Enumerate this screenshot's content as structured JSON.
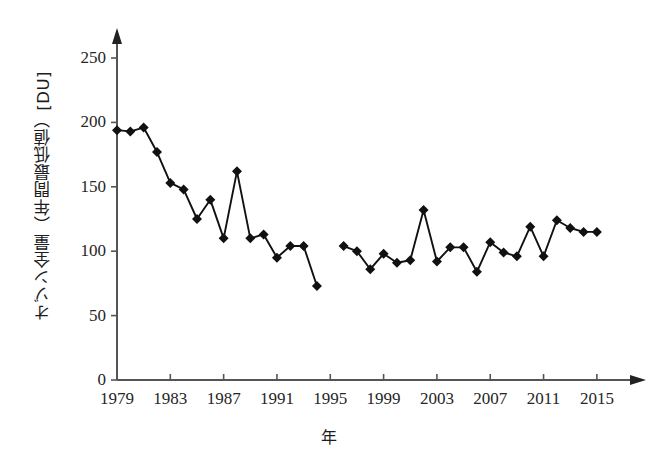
{
  "chart_data": {
    "type": "line",
    "title": "",
    "subtitle": "",
    "xlabel": "年",
    "ylabel": "オゾン全量（年間最低値）[DU]",
    "xlim": [
      1979,
      2016.5
    ],
    "ylim": [
      0,
      265
    ],
    "xticks": [
      1979,
      1983,
      1987,
      1991,
      1995,
      1999,
      2003,
      2007,
      2011,
      2015
    ],
    "xtick_labels": [
      "1979",
      "1983",
      "1987",
      "1991",
      "1995",
      "1999",
      "2003",
      "2007",
      "2011",
      "2015"
    ],
    "yticks": [
      0,
      50,
      100,
      150,
      200,
      250
    ],
    "ytick_labels": [
      "0",
      "50",
      "100",
      "150",
      "200",
      "250"
    ],
    "grid": false,
    "legend": null,
    "marker": "diamond",
    "line_color": "#111111",
    "marker_color": "#111111",
    "axis_color": "#555555",
    "background": "#ffffff",
    "note": "Line is broken between 1994 and 1996 (no data for 1995).",
    "series": [
      {
        "name": "オゾン全量（年間最低値）",
        "x": [
          1979,
          1980,
          1981,
          1982,
          1983,
          1984,
          1985,
          1986,
          1987,
          1988,
          1989,
          1990,
          1991,
          1992,
          1993,
          1994
        ],
        "values": [
          194,
          193,
          196,
          177,
          153,
          148,
          125,
          140,
          110,
          162,
          110,
          113,
          95,
          104,
          104,
          73
        ]
      },
      {
        "name": "オゾン全量（年間最低値）",
        "x": [
          1996,
          1997,
          1998,
          1999,
          2000,
          2001,
          2002,
          2003,
          2004,
          2005,
          2006,
          2007,
          2008,
          2009,
          2010,
          2011,
          2012,
          2013,
          2014,
          2015
        ],
        "values": [
          104,
          100,
          86,
          98,
          91,
          93,
          132,
          92,
          103,
          103,
          84,
          107,
          99,
          96,
          119,
          96,
          124,
          118,
          115,
          115
        ]
      }
    ]
  }
}
